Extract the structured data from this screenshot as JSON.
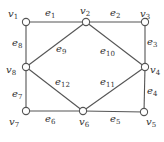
{
  "graph": {
    "nodes": [
      {
        "id": "v1",
        "base": "v",
        "sub": "1",
        "x": 26,
        "y": 22,
        "lx": 8,
        "ly": 17
      },
      {
        "id": "v2",
        "base": "v",
        "sub": "2",
        "x": 86,
        "y": 22,
        "lx": 80,
        "ly": 14
      },
      {
        "id": "v3",
        "base": "v",
        "sub": "3",
        "x": 145,
        "y": 22,
        "lx": 140,
        "ly": 17
      },
      {
        "id": "v4",
        "base": "v",
        "sub": "4",
        "x": 145,
        "y": 67,
        "lx": 150,
        "ly": 73
      },
      {
        "id": "v5",
        "base": "v",
        "sub": "5",
        "x": 144,
        "y": 112,
        "lx": 146,
        "ly": 125
      },
      {
        "id": "v6",
        "base": "v",
        "sub": "6",
        "x": 83,
        "y": 111,
        "lx": 79,
        "ly": 125
      },
      {
        "id": "v7",
        "base": "v",
        "sub": "7",
        "x": 26,
        "y": 111,
        "lx": 9,
        "ly": 125
      },
      {
        "id": "v8",
        "base": "v",
        "sub": "8",
        "x": 26,
        "y": 67,
        "lx": 6,
        "ly": 73
      }
    ],
    "edges": [
      {
        "id": "e1",
        "base": "e",
        "sub": "1",
        "from": "v1",
        "to": "v2",
        "lx": 45,
        "ly": 16
      },
      {
        "id": "e2",
        "base": "e",
        "sub": "2",
        "from": "v2",
        "to": "v3",
        "lx": 110,
        "ly": 16
      },
      {
        "id": "e3",
        "base": "e",
        "sub": "3",
        "from": "v3",
        "to": "v4",
        "lx": 147,
        "ly": 45
      },
      {
        "id": "e4",
        "base": "e",
        "sub": "4",
        "from": "v4",
        "to": "v5",
        "lx": 147,
        "ly": 94
      },
      {
        "id": "e5",
        "base": "e",
        "sub": "5",
        "from": "v5",
        "to": "v6",
        "lx": 110,
        "ly": 122
      },
      {
        "id": "e6",
        "base": "e",
        "sub": "6",
        "from": "v6",
        "to": "v7",
        "lx": 45,
        "ly": 122
      },
      {
        "id": "e7",
        "base": "e",
        "sub": "7",
        "from": "v7",
        "to": "v8",
        "lx": 12,
        "ly": 97
      },
      {
        "id": "e8",
        "base": "e",
        "sub": "8",
        "from": "v8",
        "to": "v1",
        "lx": 12,
        "ly": 46
      },
      {
        "id": "e9",
        "base": "e",
        "sub": "9",
        "from": "v8",
        "to": "v2",
        "lx": 56,
        "ly": 52
      },
      {
        "id": "e10",
        "base": "e",
        "sub": "10",
        "from": "v2",
        "to": "v4",
        "lx": 100,
        "ly": 54
      },
      {
        "id": "e11",
        "base": "e",
        "sub": "11",
        "from": "v6",
        "to": "v4",
        "lx": 100,
        "ly": 85
      },
      {
        "id": "e12",
        "base": "e",
        "sub": "12",
        "from": "v8",
        "to": "v6",
        "lx": 55,
        "ly": 85
      }
    ]
  }
}
